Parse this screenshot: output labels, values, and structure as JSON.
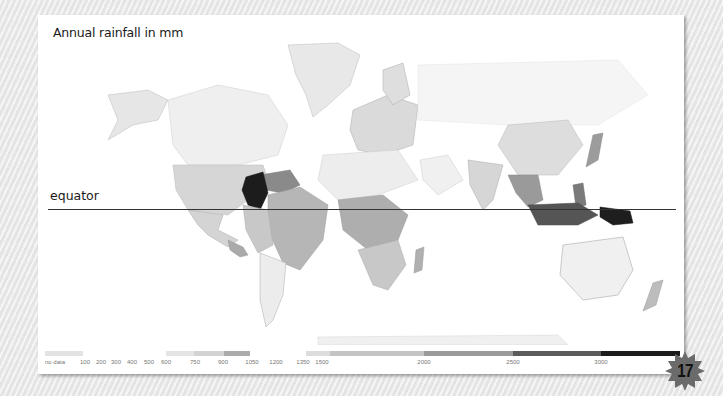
{
  "map": {
    "title": "Annual rainfall in mm",
    "equator_label": "equator"
  },
  "legend": {
    "no_data_label": "no data",
    "no_data_color": "#e2e2e2",
    "ticks": [
      {
        "label": "no data",
        "x": 17
      },
      {
        "label": "100",
        "x": 47
      },
      {
        "label": "200",
        "x": 63
      },
      {
        "label": "300",
        "x": 78
      },
      {
        "label": "400",
        "x": 94
      },
      {
        "label": "500",
        "x": 111
      },
      {
        "label": "600",
        "x": 128
      },
      {
        "label": "750",
        "x": 157
      },
      {
        "label": "900",
        "x": 185
      },
      {
        "label": "1050",
        "x": 214
      },
      {
        "label": "1200",
        "x": 238
      },
      {
        "label": "1350",
        "x": 265
      },
      {
        "label": "1500",
        "x": 284
      },
      {
        "label": "2000",
        "x": 386
      },
      {
        "label": "2500",
        "x": 475
      },
      {
        "label": "3000",
        "x": 563
      }
    ],
    "segments": [
      {
        "range": "no data",
        "x": 7,
        "w": 38,
        "color": "#e3e3e3"
      },
      {
        "range": "600-750",
        "x": 128,
        "w": 28,
        "color": "#e4e4e4"
      },
      {
        "range": "750-900",
        "x": 156,
        "w": 30,
        "color": "#d3d3d3"
      },
      {
        "range": "900-1050",
        "x": 186,
        "w": 26,
        "color": "#ababab"
      },
      {
        "range": "1350-1500",
        "x": 268,
        "w": 24,
        "color": "#dcdcdc"
      },
      {
        "range": "1500-2000",
        "x": 292,
        "w": 94,
        "color": "#c4c4c4"
      },
      {
        "range": "2000-2500",
        "x": 386,
        "w": 89,
        "color": "#9a9a9a"
      },
      {
        "range": "2500-3000",
        "x": 475,
        "w": 88,
        "color": "#5c5c5c"
      },
      {
        "range": "3000+",
        "x": 563,
        "w": 79,
        "color": "#1c1c1c"
      }
    ]
  },
  "page_badge": {
    "number": "17",
    "color": "#6b6b6b"
  },
  "chart_data": {
    "type": "heatmap",
    "title": "Annual rainfall in mm",
    "subtype": "choropleth world map",
    "annotations": [
      "equator"
    ],
    "legend_scale_mm": [
      "no data",
      100,
      200,
      300,
      400,
      500,
      600,
      750,
      900,
      1050,
      1200,
      1350,
      1500,
      2000,
      2500,
      3000
    ],
    "color_scale": "greyscale, light (low) to black (high)",
    "notable_regions": [
      {
        "region": "Colombia",
        "rainfall": "3000+",
        "shade": "black"
      },
      {
        "region": "Papua New Guinea",
        "rainfall": "3000+",
        "shade": "black"
      },
      {
        "region": "Indonesia / Malaysia",
        "rainfall": "2500-3000",
        "shade": "dark grey"
      },
      {
        "region": "Venezuela / Guianas",
        "rainfall": "2000-2500",
        "shade": "mid-dark grey"
      },
      {
        "region": "Brazil",
        "rainfall": "1500-2000",
        "shade": "mid grey"
      },
      {
        "region": "Central Africa",
        "rainfall": "1350-2000",
        "shade": "mid grey"
      },
      {
        "region": "USA / Europe / China",
        "rainfall": "600-900",
        "shade": "light grey"
      },
      {
        "region": "Sahara / Arabia / Australia",
        "rainfall": "0-600",
        "shade": "near white"
      }
    ]
  }
}
